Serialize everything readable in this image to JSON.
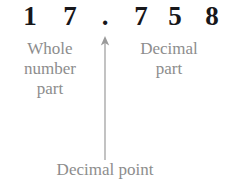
{
  "diagram": {
    "number": {
      "value": "17.758",
      "whole_part": "17",
      "decimal_part": "758",
      "separator": ".",
      "digits": [
        {
          "char": "1",
          "role": "whole-digit"
        },
        {
          "char": "7",
          "role": "whole-digit"
        },
        {
          "char": ".",
          "role": "decimal-point"
        },
        {
          "char": "7",
          "role": "decimal-digit"
        },
        {
          "char": "5",
          "role": "decimal-digit"
        },
        {
          "char": "8",
          "role": "decimal-digit"
        }
      ]
    },
    "labels": {
      "whole": "Whole\nnumber\npart",
      "decimal": "Decimal\npart",
      "point": "Decimal point"
    },
    "annotation": {
      "arrow": "up-arrow",
      "points_to": "."
    },
    "colors": {
      "digit": "#17171a",
      "label": "#8d8d8d",
      "arrow": "#9a9a9a",
      "background": "#ffffff"
    }
  }
}
